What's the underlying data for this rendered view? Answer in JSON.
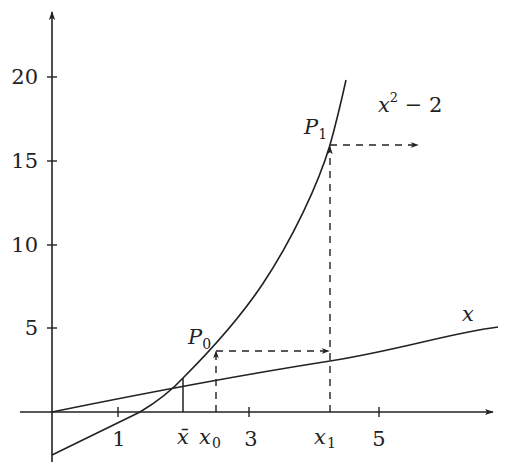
{
  "diagram": {
    "y_axis": {
      "ticks": [
        {
          "value": 20,
          "label": "20"
        },
        {
          "value": 15,
          "label": "15"
        },
        {
          "value": 10,
          "label": "10"
        },
        {
          "value": 5,
          "label": "5"
        }
      ]
    },
    "x_axis": {
      "ticks": [
        {
          "value": 1,
          "label": "1"
        },
        {
          "value": 3,
          "label": "3"
        },
        {
          "value": 5,
          "label": "5"
        }
      ],
      "special_labels": {
        "xbar": "x̄",
        "x0": "x",
        "x0_sub": "0",
        "x1": "x",
        "x1_sub": "1"
      }
    },
    "curves": {
      "parabola_label": "x",
      "parabola_label_sup": "2",
      "parabola_label_rest": " − 2",
      "line_label": "x"
    },
    "points": {
      "P0": "P",
      "P0_sub": "0",
      "P1": "P",
      "P1_sub": "1"
    },
    "colors": {
      "ink": "#222222",
      "background": "#ffffff"
    }
  }
}
